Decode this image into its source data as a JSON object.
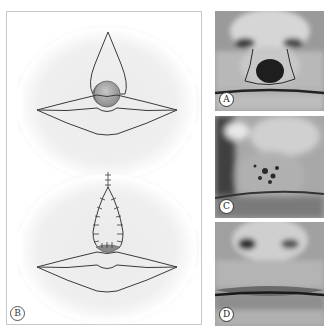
{
  "figure": {
    "panels": [
      {
        "id": "A",
        "label": "A",
        "type": "photo",
        "description": "Lesion on upper lip below nose with incision marking"
      },
      {
        "id": "B",
        "label": "B",
        "type": "illustration",
        "description": "Diagrams: lesion with teardrop excision above lip, and sutured closure"
      },
      {
        "id": "C",
        "label": "C",
        "type": "photo",
        "description": "Healing wound on upper lip"
      },
      {
        "id": "D",
        "label": "D",
        "type": "photo",
        "description": "Final healed result of lips"
      }
    ],
    "colors": {
      "panel_border": "#c8c8c8",
      "line": "#3a3a3a",
      "lesion_fill": "#a0a0a0",
      "background_blur": "#cfcfcf"
    }
  }
}
